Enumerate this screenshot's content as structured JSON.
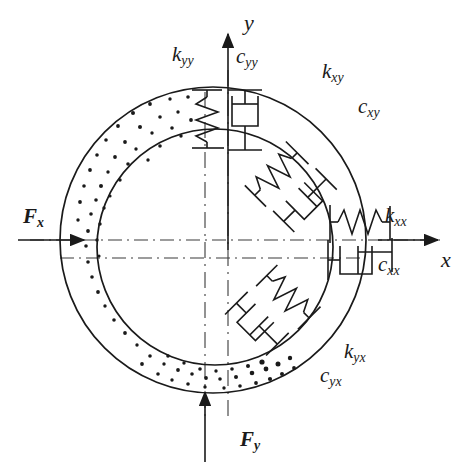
{
  "figure": {
    "type": "engineering-diagram",
    "background_color": "#ffffff",
    "line_color": "#1a1a1a"
  },
  "axes": {
    "x": {
      "label": "x",
      "sub": "",
      "direction": "right"
    },
    "y": {
      "label": "y",
      "sub": "",
      "direction": "up"
    }
  },
  "forces": [
    {
      "name": "force-fx",
      "label": "F",
      "sub": "x",
      "direction": "right",
      "position": "left"
    },
    {
      "name": "force-fy",
      "label": "F",
      "sub": "y",
      "direction": "up",
      "position": "bottom"
    }
  ],
  "elements": [
    {
      "name": "stiffness-kyy",
      "label": "k",
      "sub": "yy",
      "kind": "spring",
      "orientation": "vertical",
      "location": "top-left-of-y-axis"
    },
    {
      "name": "damping-cyy",
      "label": "c",
      "sub": "yy",
      "kind": "dashpot",
      "orientation": "vertical",
      "location": "top-right-of-y-axis"
    },
    {
      "name": "stiffness-kxy",
      "label": "k",
      "sub": "xy",
      "kind": "spring",
      "orientation": "diagonal-45",
      "location": "upper-right"
    },
    {
      "name": "damping-cxy",
      "label": "c",
      "sub": "xy",
      "kind": "dashpot",
      "orientation": "diagonal-45",
      "location": "upper-right"
    },
    {
      "name": "stiffness-kxx",
      "label": "k",
      "sub": "xx",
      "kind": "spring",
      "orientation": "horizontal",
      "location": "right-above-axis"
    },
    {
      "name": "damping-cxx",
      "label": "c",
      "sub": "xx",
      "kind": "dashpot",
      "orientation": "horizontal",
      "location": "right-below-axis"
    },
    {
      "name": "stiffness-kyx",
      "label": "k",
      "sub": "yx",
      "kind": "spring",
      "orientation": "diagonal-315",
      "location": "lower-right"
    },
    {
      "name": "damping-cyx",
      "label": "c",
      "sub": "yx",
      "kind": "dashpot",
      "orientation": "diagonal-315",
      "location": "lower-right"
    }
  ],
  "geometry": {
    "outer_circle": {
      "cx": 213,
      "cy": 240,
      "r": 153
    },
    "inner_circle": {
      "cx": 215,
      "cy": 247,
      "r": 118
    },
    "annulus_fill": "stipple-dots"
  }
}
